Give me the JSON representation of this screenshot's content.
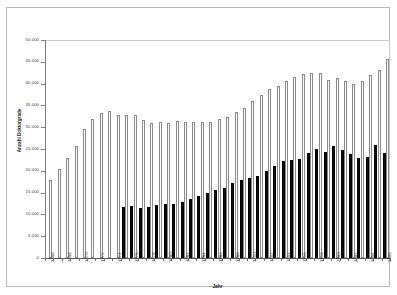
{
  "chart_data": {
    "type": "bar",
    "title": "",
    "xlabel": "Jahr",
    "ylabel": "Anzahl Doktorgrade",
    "ylim": [
      0,
      50000
    ],
    "ytick_labels": [
      "50.000",
      "45.000",
      "40.000",
      "35.000",
      "30.000",
      "25.000",
      "20.000",
      "15.000",
      "10.000",
      "5.000",
      "0"
    ],
    "ytick_values": [
      50000,
      45000,
      40000,
      35000,
      30000,
      25000,
      20000,
      15000,
      10000,
      5000,
      0
    ],
    "grid": false,
    "legend": "none",
    "categories": [
      "1966",
      "1967",
      "1968",
      "1969",
      "1970",
      "1971",
      "1972",
      "1973",
      "1974",
      "1975",
      "1976",
      "1977",
      "1978",
      "1979",
      "1980",
      "1981",
      "1982",
      "1983",
      "1984",
      "1985",
      "1986",
      "1987",
      "1988",
      "1989",
      "1990",
      "1991",
      "1992",
      "1993",
      "1994",
      "1995",
      "1996",
      "1997",
      "1998",
      "1999",
      "2000",
      "2001",
      "2002",
      "2003",
      "2004",
      "2005",
      "2006"
    ],
    "xtick_labels_shown": [
      "1966",
      "1968",
      "1970",
      "1972",
      "1974",
      "1976",
      "1978",
      "1980",
      "1982",
      "1984",
      "1986",
      "1988",
      "1990",
      "1992",
      "1994",
      "1996",
      "1998",
      "2000",
      "2002",
      "2004",
      "2006"
    ],
    "series": [
      {
        "name": "Gesamt",
        "color": "#ffffff",
        "edge_color": "#8a8a8a",
        "values": [
          17800,
          20500,
          23000,
          25700,
          29500,
          31900,
          33200,
          33800,
          32800,
          32900,
          32900,
          31700,
          30900,
          31200,
          30900,
          31500,
          31200,
          31200,
          31300,
          31200,
          31900,
          32400,
          33500,
          34400,
          36000,
          37500,
          38800,
          39500,
          40700,
          41600,
          42300,
          42400,
          42400,
          40900,
          41200,
          40600,
          39900,
          40500,
          41900,
          43200,
          45600
        ]
      },
      {
        "name": "Teilmenge",
        "color": "#0d0d0d",
        "edge_color": "#000000",
        "values": [
          null,
          null,
          null,
          null,
          null,
          null,
          null,
          null,
          null,
          11600,
          11900,
          11400,
          11800,
          12100,
          12400,
          12300,
          12900,
          13600,
          14200,
          15000,
          15500,
          16100,
          17200,
          17900,
          18400,
          18800,
          20000,
          21000,
          22300,
          22500,
          22800,
          24100,
          24900,
          24400,
          25700,
          24800,
          23800,
          23000,
          23100,
          26000,
          24200
        ]
      }
    ]
  },
  "figure": {
    "y_axis_title": "Anzahl Doktorgrade",
    "x_axis_title": "Jahr"
  }
}
